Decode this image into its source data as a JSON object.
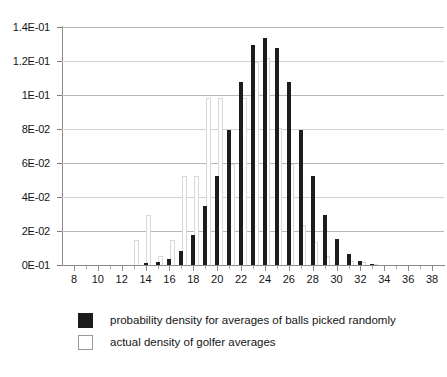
{
  "chart_data": {
    "type": "bar",
    "title": "",
    "subtitle": "",
    "xlabel": "",
    "ylabel": "",
    "xlim": [
      7,
      39
    ],
    "ylim": [
      0,
      0.14
    ],
    "grid": true,
    "legend_position": "bottom-left",
    "y_tick_labels": [
      "1.4E-01",
      "1.2E-01",
      "1E-01",
      "8E-02",
      "6E-02",
      "4E-02",
      "2E-02",
      "0E-01"
    ],
    "y_tick_values": [
      0.14,
      0.12,
      0.1,
      0.08,
      0.06,
      0.04,
      0.02,
      0
    ],
    "x_tick_labels": [
      "8",
      "10",
      "12",
      "14",
      "16",
      "18",
      "20",
      "22",
      "24",
      "26",
      "28",
      "30",
      "32",
      "34",
      "36",
      "38"
    ],
    "x_tick_values": [
      8,
      10,
      12,
      14,
      16,
      18,
      20,
      22,
      24,
      26,
      28,
      30,
      32,
      34,
      36,
      38
    ],
    "x": [
      8,
      9,
      10,
      11,
      12,
      13,
      14,
      15,
      16,
      17,
      18,
      19,
      20,
      21,
      22,
      23,
      24,
      25,
      26,
      27,
      28,
      29,
      30,
      31,
      32,
      33,
      34,
      35,
      36,
      37,
      38
    ],
    "series": [
      {
        "name": "probability density for averages of balls picked randomly",
        "color": "#1c1c1c",
        "style": "filled",
        "values": [
          0,
          0,
          0,
          0,
          0,
          0,
          0.0012,
          0.0018,
          0.0035,
          0.0085,
          0.0175,
          0.0345,
          0.0525,
          0.0795,
          0.1075,
          0.1295,
          0.1335,
          0.1275,
          0.1075,
          0.0795,
          0.0525,
          0.0295,
          0.0155,
          0.0065,
          0.0025,
          0.0008,
          0,
          0,
          0,
          0,
          0
        ]
      },
      {
        "name": "actual density of golfer averages",
        "color": "#ffffff",
        "style": "outlined",
        "values": [
          0,
          0,
          0,
          0,
          0,
          0.0145,
          0.0295,
          0.0055,
          0.0145,
          0.0525,
          0.0525,
          0.0985,
          0.0985,
          0.0595,
          0.0985,
          0.1195,
          0.1215,
          0.0805,
          0.0595,
          0.0235,
          0.0135,
          0.0055,
          0,
          0.0025,
          0.0015,
          0.0008,
          0,
          0,
          0,
          0,
          0
        ]
      }
    ]
  },
  "legend": {
    "items": [
      {
        "label": "probability density for averages of balls picked randomly",
        "swatch": "dark"
      },
      {
        "label": "actual density of golfer averages",
        "swatch": "light"
      }
    ]
  }
}
